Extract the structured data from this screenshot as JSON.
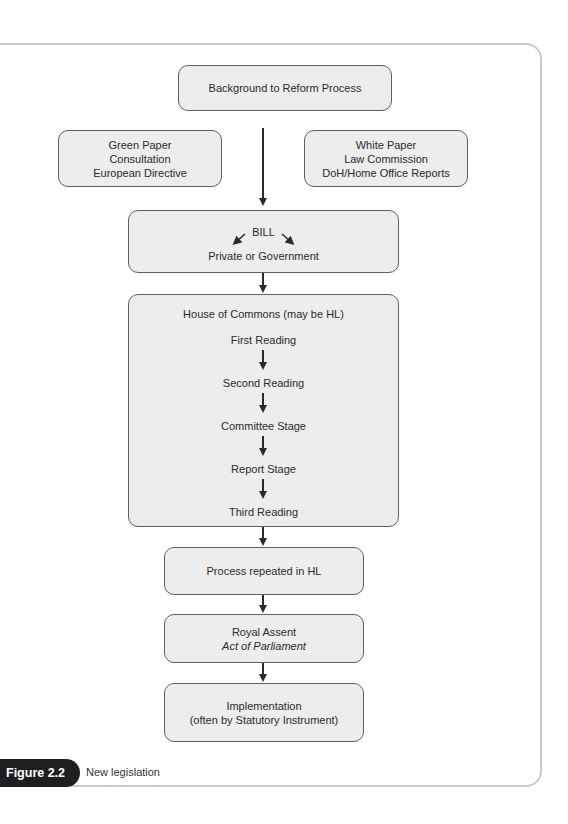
{
  "figure": {
    "label": "Figure 2.2",
    "caption": "New legislation"
  },
  "boxes": {
    "background": {
      "lines": [
        "Background to Reform Process"
      ]
    },
    "green_paper": {
      "lines": [
        "Green Paper",
        "Consultation",
        "European Directive"
      ]
    },
    "white_paper": {
      "lines": [
        "White Paper",
        "Law Commission",
        "DoH/Home Office Reports"
      ]
    },
    "bill": {
      "title": "BILL",
      "subtitle": "Private or Government"
    },
    "house_of_commons": {
      "title": "House of Commons (may be HL)",
      "stages": [
        "First Reading",
        "Second Reading",
        "Committee Stage",
        "Report Stage",
        "Third Reading"
      ]
    },
    "repeated": {
      "lines": [
        "Process repeated in HL"
      ]
    },
    "royal_assent": {
      "title": "Royal Assent",
      "subtitle": "Act of Parliament"
    },
    "implementation": {
      "lines": [
        "Implementation",
        "(often by Statutory Instrument)"
      ]
    }
  },
  "colors": {
    "box_fill": "#ededed",
    "box_border": "#5f5f5f",
    "frame_border": "#c9c9c9",
    "badge_fill": "#1f1f1f",
    "arrow": "#2a2a2a"
  }
}
